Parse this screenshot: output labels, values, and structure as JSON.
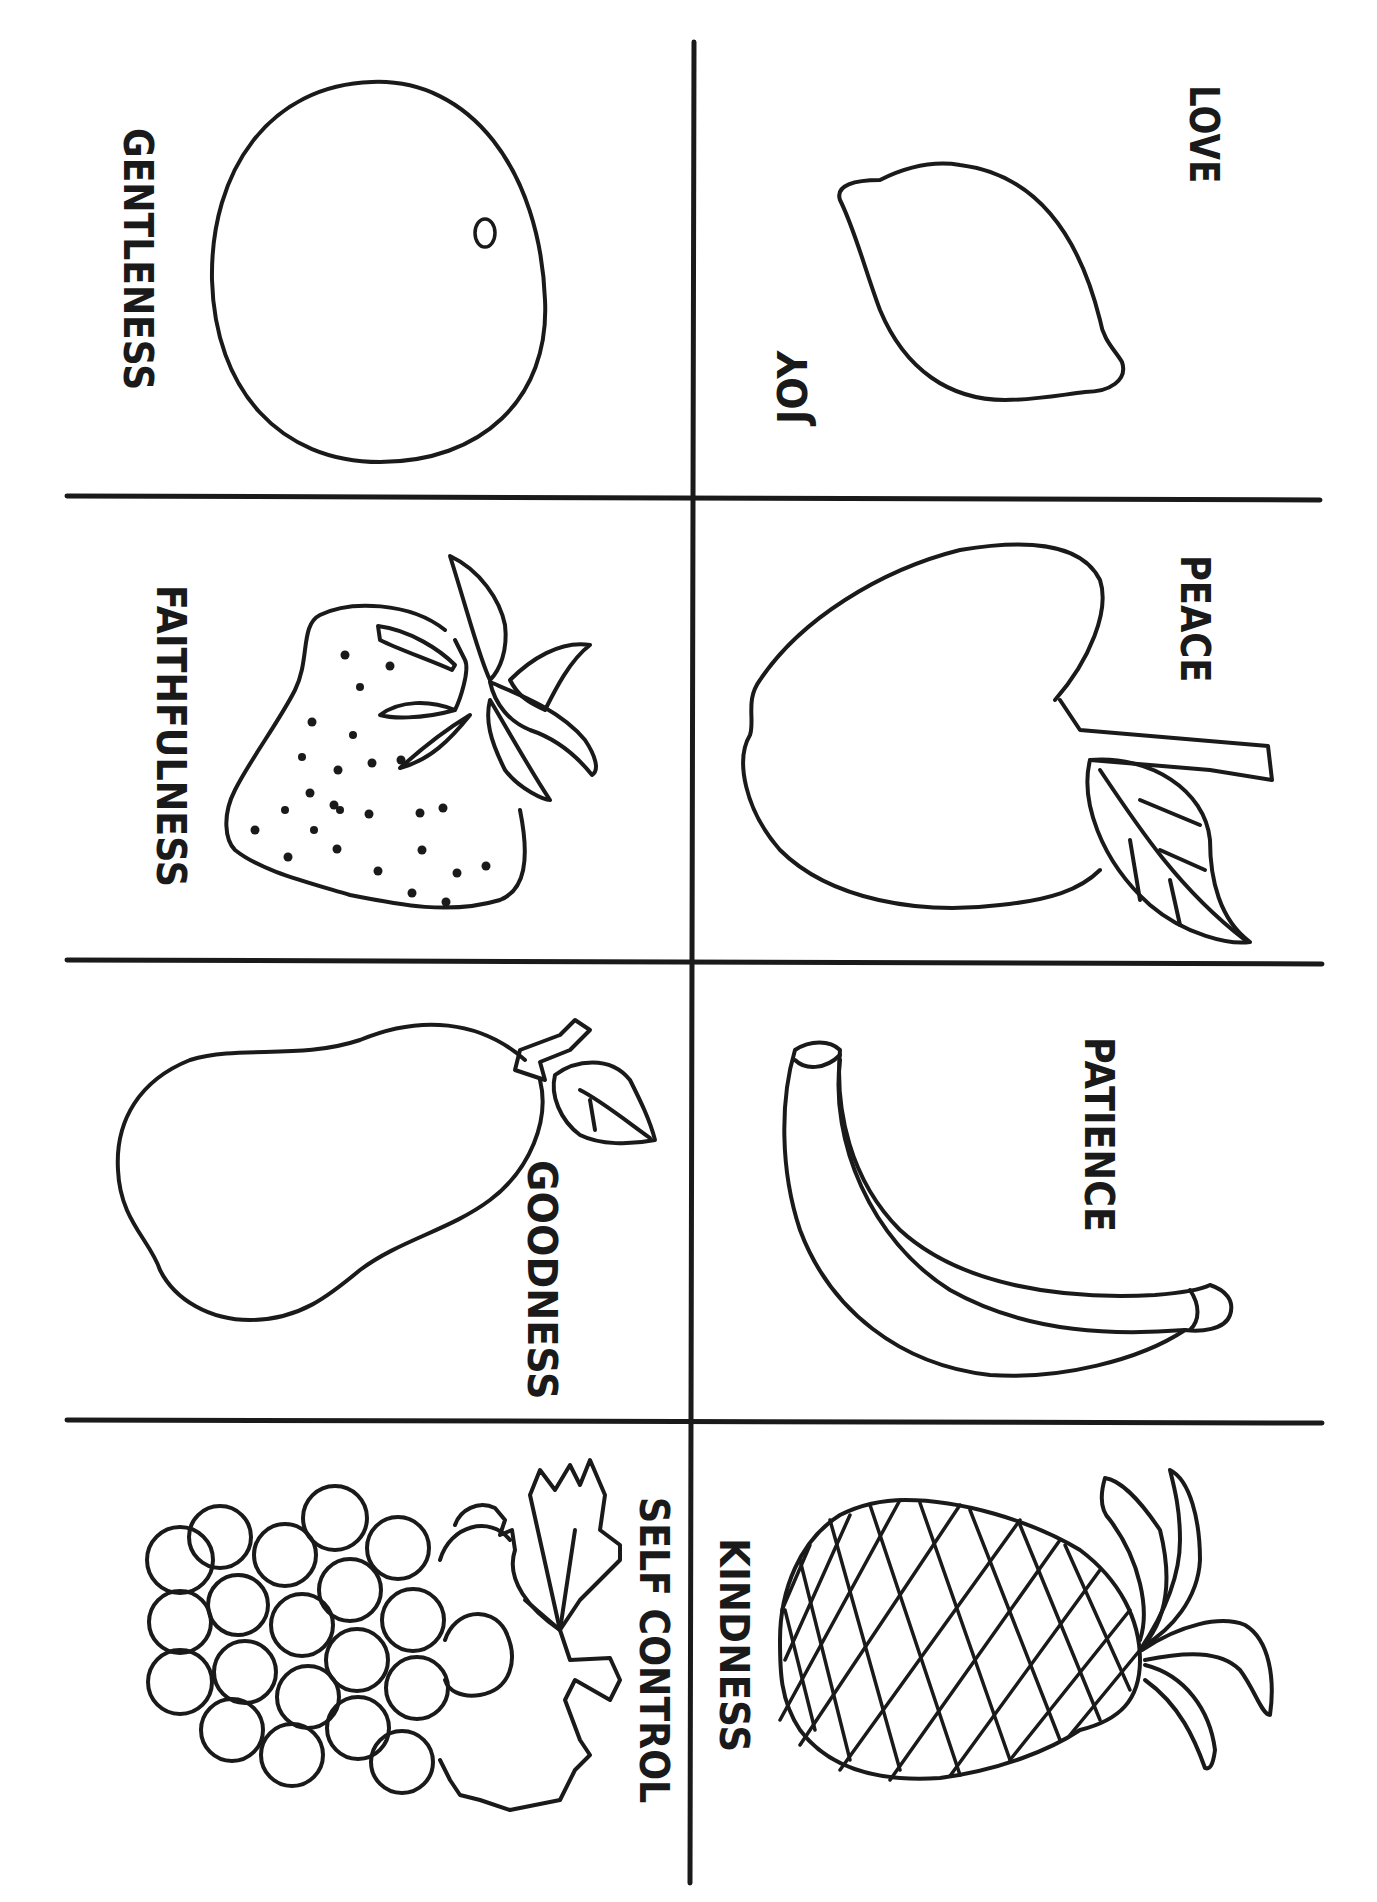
{
  "page": {
    "type": "coloring-page",
    "background": "#ffffff",
    "ink_color": "#1a1a1a"
  },
  "cells": [
    {
      "id": "love-joy",
      "fruit": "lemon",
      "labels": [
        "LOVE",
        "JOY"
      ]
    },
    {
      "id": "gentleness",
      "fruit": "orange",
      "labels": [
        "GENTLENESS"
      ]
    },
    {
      "id": "peace",
      "fruit": "apple",
      "labels": [
        "PEACE"
      ]
    },
    {
      "id": "faithfulness",
      "fruit": "strawberry",
      "labels": [
        "FAITHFULNESS"
      ]
    },
    {
      "id": "patience",
      "fruit": "banana",
      "labels": [
        "PATIENCE"
      ]
    },
    {
      "id": "goodness",
      "fruit": "pear",
      "labels": [
        "GOODNESS"
      ]
    },
    {
      "id": "kindness",
      "fruit": "pineapple",
      "labels": [
        "KINDNESS"
      ]
    },
    {
      "id": "self-control",
      "fruit": "grapes",
      "labels": [
        "SELF CONTROL"
      ]
    }
  ],
  "labels": {
    "love": "LOVE",
    "joy": "JOY",
    "gentleness": "GENTLENESS",
    "peace": "PEACE",
    "faithfulness": "FAITHFULNESS",
    "patience": "PATIENCE",
    "goodness": "GOODNESS",
    "kindness": "KINDNESS",
    "self_control": "SELF CONTROL"
  }
}
